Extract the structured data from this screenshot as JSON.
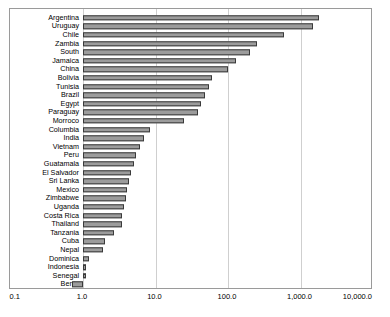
{
  "chart_data": {
    "type": "bar",
    "orientation": "horizontal",
    "title": "",
    "subtitle": "",
    "xlabel": "",
    "ylabel": "",
    "xscale": "log",
    "xlim": [
      0.1,
      10000
    ],
    "grid": true,
    "legend": null,
    "xticks": [
      "0.1",
      "1.0",
      "10.0",
      "100.0",
      "1,000.0",
      "10,000.0"
    ],
    "xtick_values": [
      0.1,
      1,
      10,
      100,
      1000,
      10000
    ],
    "categories": [
      "Argentina",
      "Uruguay",
      "Chile",
      "Zambia",
      "South",
      "Jamaica",
      "China",
      "Bolivia",
      "Tunisia",
      "Brazil",
      "Egypt",
      "Paraguay",
      "Morroco",
      "Columbia",
      "India",
      "Vietnam",
      "Peru",
      "Guatamala",
      "El Salvador",
      "Sri Lanka",
      "Mexico",
      "Zimbabwe",
      "Uganda",
      "Costa Rica",
      "Thailand",
      "Tanzania",
      "Cuba",
      "Nepal",
      "Dominica",
      "Indonesia",
      "Senegal",
      "Benin"
    ],
    "values": [
      1800,
      1500,
      600,
      250,
      200,
      130,
      100,
      60,
      55,
      48,
      42,
      38,
      25,
      8.5,
      7.0,
      6.2,
      5.4,
      5.0,
      4.6,
      4.3,
      4.1,
      3.9,
      3.7,
      3.5,
      3.4,
      2.7,
      2.0,
      1.9,
      1.2,
      1.05,
      1.05,
      0.7
    ],
    "bar_color": "#9c9c9c",
    "bar_edge_color": "#3a3a3a"
  }
}
